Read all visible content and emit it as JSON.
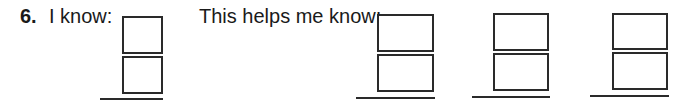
{
  "problem": {
    "number": "6.",
    "prompt_known": "I know:",
    "prompt_helps": "This helps me know:"
  },
  "fraction_boxes": [
    {
      "id": "known",
      "numerator": "",
      "denominator": "",
      "answer": ""
    },
    {
      "id": "helps-1",
      "numerator": "",
      "denominator": "",
      "answer": ""
    },
    {
      "id": "helps-2",
      "numerator": "",
      "denominator": "",
      "answer": ""
    },
    {
      "id": "helps-3",
      "numerator": "",
      "denominator": "",
      "answer": ""
    }
  ]
}
